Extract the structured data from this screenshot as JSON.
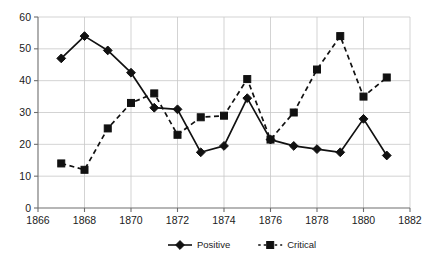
{
  "chart_data": {
    "type": "line",
    "title": "",
    "subtitle": "",
    "xlabel": "",
    "ylabel": "",
    "xlim": [
      1866,
      1882
    ],
    "ylim": [
      0,
      60
    ],
    "x_ticks": [
      1866,
      1868,
      1870,
      1872,
      1874,
      1876,
      1878,
      1880,
      1882
    ],
    "y_ticks": [
      0,
      10,
      20,
      30,
      40,
      50,
      60
    ],
    "grid": true,
    "legend_position": "bottom",
    "x": [
      1867,
      1868,
      1869,
      1870,
      1871,
      1872,
      1873,
      1874,
      1875,
      1876,
      1877,
      1878,
      1879,
      1880,
      1881
    ],
    "series": [
      {
        "name": "Positive",
        "marker": "diamond",
        "linestyle": "solid",
        "color": "#111111",
        "values": [
          47,
          54,
          49.5,
          42.5,
          31.5,
          31,
          17.5,
          19.5,
          34.5,
          21.5,
          19.5,
          18.5,
          17.5,
          28,
          16.5
        ]
      },
      {
        "name": "Critical",
        "marker": "square",
        "linestyle": "dashed",
        "color": "#111111",
        "values": [
          14,
          12,
          25,
          33,
          36,
          23,
          28.5,
          29,
          40.5,
          21.5,
          30,
          43.5,
          54,
          35,
          41
        ]
      }
    ],
    "legend": [
      {
        "label": "Positive",
        "marker": "diamond",
        "linestyle": "solid"
      },
      {
        "label": "Critical",
        "marker": "square",
        "linestyle": "dashed"
      }
    ],
    "colors": {
      "background": "#ffffff",
      "gridline": "#c8c8c8",
      "axis": "#6e6e6e",
      "ink": "#111111"
    }
  }
}
